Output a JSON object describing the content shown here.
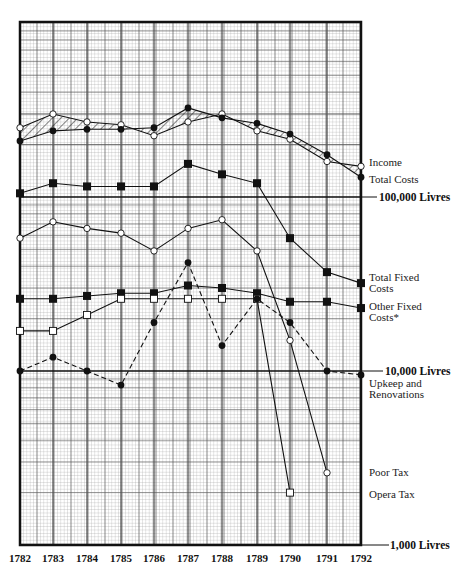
{
  "chart_data": {
    "type": "line",
    "title": "",
    "xlabel": "",
    "ylabel": "",
    "y_scale": "log",
    "ylim": [
      1000,
      400000
    ],
    "grid": true,
    "legend_position": "right (labels at line ends)",
    "x": [
      "1782",
      "1783",
      "1784",
      "1785",
      "1786",
      "1787",
      "1788",
      "1789",
      "1790",
      "1791",
      "1792"
    ],
    "y_ticks": [
      {
        "value": 100000,
        "label": "100,000 Livres"
      },
      {
        "value": 10000,
        "label": "10,000 Livres"
      },
      {
        "value": 1000,
        "label": "1,000 Livres"
      }
    ],
    "series": [
      {
        "name": "Income",
        "marker": "open-circle",
        "style": "solid",
        "values": [
          250000,
          300000,
          270000,
          260000,
          225000,
          270000,
          300000,
          240000,
          215000,
          160000,
          150000
        ]
      },
      {
        "name": "Total Costs",
        "marker": "filled-circle",
        "style": "solid",
        "values": [
          210000,
          240000,
          245000,
          245000,
          250000,
          325000,
          285000,
          265000,
          230000,
          175000,
          130000
        ]
      },
      {
        "name": "Total Fixed Costs",
        "marker": "filled-square",
        "style": "solid",
        "values": [
          105000,
          120000,
          115000,
          115000,
          115000,
          155000,
          135000,
          120000,
          58000,
          37000,
          32000
        ]
      },
      {
        "name": "Other Fixed Costs*",
        "marker": "filled-square",
        "style": "solid",
        "values": [
          26000,
          26000,
          27000,
          28000,
          28000,
          31000,
          30000,
          28000,
          25000,
          25000,
          23000
        ]
      },
      {
        "name": "Poor Tax",
        "marker": "open-circle",
        "style": "solid",
        "values": [
          58000,
          72000,
          66000,
          62000,
          49000,
          66000,
          74000,
          49000,
          15000,
          2600,
          null
        ]
      },
      {
        "name": "Opera Tax",
        "marker": "open-square",
        "style": "solid",
        "values": [
          17000,
          17000,
          21000,
          26000,
          26000,
          26000,
          26000,
          26000,
          2000,
          null,
          null
        ]
      },
      {
        "name": "Upkeep and Renovations",
        "marker": "filled-circle",
        "style": "dashed",
        "values": [
          10000,
          12000,
          10000,
          8300,
          19000,
          42000,
          14000,
          26000,
          19000,
          10000,
          9500
        ]
      }
    ],
    "annotations": [
      "* Other Fixed Costs"
    ]
  },
  "labels": {
    "y_100000": "100,000 Livres",
    "y_10000": "10,000 Livres",
    "y_1000": "1,000 Livres",
    "income": "Income",
    "total_costs": "Total Costs",
    "total_fixed_1": "Total Fixed",
    "total_fixed_2": "Costs",
    "other_fixed_1": "Other Fixed",
    "other_fixed_2": "Costs*",
    "upkeep_1": "Upkeep and",
    "upkeep_2": "Renovations",
    "poor_tax": "Poor Tax",
    "opera_tax": "Opera Tax",
    "years": [
      "1782",
      "1783",
      "1784",
      "1785",
      "1786",
      "1787",
      "1788",
      "1789",
      "1790",
      "1791",
      "1792"
    ]
  }
}
